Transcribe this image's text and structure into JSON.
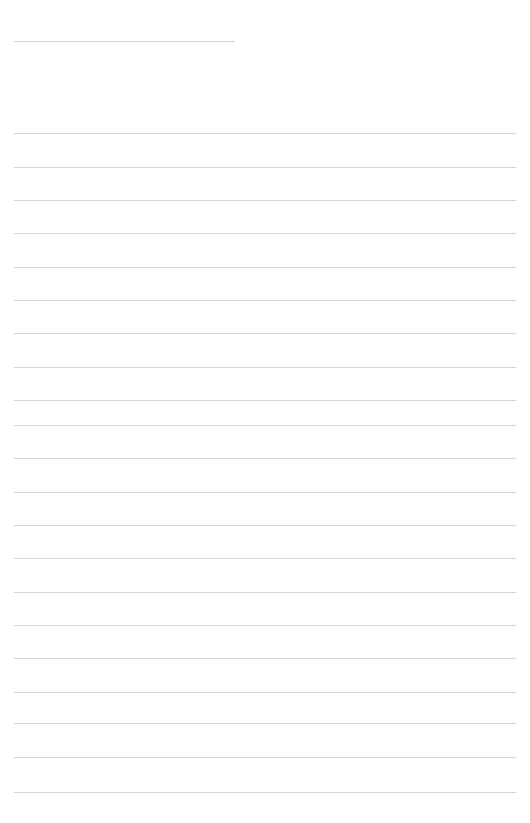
{
  "document": {
    "kind": "ruled-notebook-page",
    "background_color": "#ffffff",
    "width_px": 530,
    "height_px": 823
  },
  "header": {
    "title_text": "",
    "rule": {
      "left_px": 14,
      "top_px": 41,
      "width_px": 221,
      "color": "#d4d4d8",
      "thickness_px": 1
    }
  },
  "body": {
    "line_color": "#d6d6da",
    "line_thickness_px": 1,
    "left_px": 14,
    "right_px": 516,
    "line_width_px": 502,
    "first_line_y_px": 133,
    "line_spacing_px": 33.4,
    "line_count": 20,
    "lines": [
      {
        "index": 1,
        "y_px": 133,
        "text": ""
      },
      {
        "index": 2,
        "y_px": 167,
        "text": ""
      },
      {
        "index": 3,
        "y_px": 200,
        "text": ""
      },
      {
        "index": 4,
        "y_px": 233,
        "text": ""
      },
      {
        "index": 5,
        "y_px": 267,
        "text": ""
      },
      {
        "index": 6,
        "y_px": 300,
        "text": ""
      },
      {
        "index": 7,
        "y_px": 333,
        "text": ""
      },
      {
        "index": 8,
        "y_px": 367,
        "text": ""
      },
      {
        "index": 9,
        "y_px": 400,
        "text": ""
      },
      {
        "index": 10,
        "y_px": 425,
        "text": ""
      },
      {
        "index": 11,
        "y_px": 458,
        "text": ""
      },
      {
        "index": 12,
        "y_px": 492,
        "text": ""
      },
      {
        "index": 13,
        "y_px": 525,
        "text": ""
      },
      {
        "index": 14,
        "y_px": 558,
        "text": ""
      },
      {
        "index": 15,
        "y_px": 592,
        "text": ""
      },
      {
        "index": 16,
        "y_px": 625,
        "text": ""
      },
      {
        "index": 17,
        "y_px": 658,
        "text": ""
      },
      {
        "index": 18,
        "y_px": 692,
        "text": ""
      },
      {
        "index": 19,
        "y_px": 723,
        "text": ""
      },
      {
        "index": 20,
        "y_px": 757,
        "text": ""
      },
      {
        "index": 21,
        "y_px": 792,
        "text": ""
      }
    ]
  }
}
